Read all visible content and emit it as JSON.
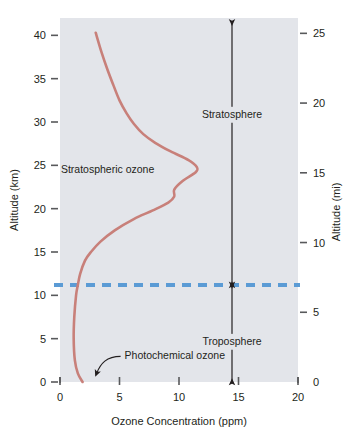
{
  "chart_data": {
    "type": "line",
    "title": "",
    "xlabel": "Ozone Concentration (ppm)",
    "ylabel": "Altitude (km)",
    "y2label": "Altitude (mi)",
    "xlim": [
      0,
      20
    ],
    "ylim": [
      0,
      42
    ],
    "y2lim": [
      0,
      26.1
    ],
    "grid": false,
    "legend": "none",
    "xticks": [
      0,
      5,
      10,
      15,
      20
    ],
    "xticklabels": [
      "0",
      "5",
      "10",
      "15",
      "20"
    ],
    "yticks": [
      0,
      5,
      10,
      15,
      20,
      25,
      30,
      35,
      40
    ],
    "yticklabels": [
      "0",
      "5",
      "10",
      "15",
      "20",
      "25",
      "30",
      "35",
      "40"
    ],
    "y2ticks": [
      0,
      5,
      10,
      15,
      20,
      25
    ],
    "y2ticklabels": [
      "0",
      "5",
      "10",
      "15",
      "20",
      "25"
    ],
    "series": [
      {
        "name": "Ozone concentration profile",
        "color": "#c8807a",
        "x_is_concentration": true,
        "points": [
          {
            "ozone_ppm": 1.9,
            "altitude_km": 0.0
          },
          {
            "ozone_ppm": 1.5,
            "altitude_km": 1.0
          },
          {
            "ozone_ppm": 1.25,
            "altitude_km": 2.5
          },
          {
            "ozone_ppm": 1.15,
            "altitude_km": 5.0
          },
          {
            "ozone_ppm": 1.2,
            "altitude_km": 7.5
          },
          {
            "ozone_ppm": 1.35,
            "altitude_km": 10.0
          },
          {
            "ozone_ppm": 1.5,
            "altitude_km": 11.2
          },
          {
            "ozone_ppm": 1.7,
            "altitude_km": 12.5
          },
          {
            "ozone_ppm": 2.1,
            "altitude_km": 14.0
          },
          {
            "ozone_ppm": 2.6,
            "altitude_km": 15.0
          },
          {
            "ozone_ppm": 3.4,
            "altitude_km": 16.2
          },
          {
            "ozone_ppm": 4.6,
            "altitude_km": 17.5
          },
          {
            "ozone_ppm": 6.2,
            "altitude_km": 18.8
          },
          {
            "ozone_ppm": 7.8,
            "altitude_km": 19.8
          },
          {
            "ozone_ppm": 9.1,
            "altitude_km": 20.7
          },
          {
            "ozone_ppm": 9.6,
            "altitude_km": 21.4
          },
          {
            "ozone_ppm": 9.6,
            "altitude_km": 22.2
          },
          {
            "ozone_ppm": 10.3,
            "altitude_km": 23.2
          },
          {
            "ozone_ppm": 11.4,
            "altitude_km": 24.2
          },
          {
            "ozone_ppm": 11.5,
            "altitude_km": 24.8
          },
          {
            "ozone_ppm": 10.8,
            "altitude_km": 25.6
          },
          {
            "ozone_ppm": 9.3,
            "altitude_km": 26.6
          },
          {
            "ozone_ppm": 8.0,
            "altitude_km": 27.6
          },
          {
            "ozone_ppm": 7.0,
            "altitude_km": 28.6
          },
          {
            "ozone_ppm": 6.2,
            "altitude_km": 29.8
          },
          {
            "ozone_ppm": 5.6,
            "altitude_km": 31.0
          },
          {
            "ozone_ppm": 5.0,
            "altitude_km": 32.5
          },
          {
            "ozone_ppm": 4.5,
            "altitude_km": 34.2
          },
          {
            "ozone_ppm": 4.0,
            "altitude_km": 36.0
          },
          {
            "ozone_ppm": 3.5,
            "altitude_km": 38.0
          },
          {
            "ozone_ppm": 3.0,
            "altitude_km": 40.3
          }
        ]
      }
    ],
    "reference_lines": [
      {
        "name": "tropopause",
        "orientation": "horizontal",
        "altitude_km": 11.2,
        "style": "dashed",
        "color": "#5b9bd5"
      }
    ],
    "annotations": [
      {
        "name": "stratospheric-ozone",
        "text": "Stratospheric ozone",
        "ozone_ppm": 4.0,
        "altitude_km": 24.6
      },
      {
        "name": "photochemical-ozone",
        "text": "Photochemical ozone",
        "ozone_ppm": 6.1,
        "altitude_km": 3.3
      }
    ],
    "zones": [
      {
        "name": "stratosphere",
        "label": "Stratosphere",
        "from_km": 11.2,
        "to_km": 41.5,
        "label_altitude_km": 30.6
      },
      {
        "name": "troposphere",
        "label": "Troposphere",
        "from_km": 0.0,
        "to_km": 11.2,
        "label_altitude_km": 4.4
      }
    ]
  },
  "colors": {
    "plot_background": "#e3e5ea",
    "curve": "#c8807a",
    "tropopause": "#5b9bd5",
    "axis": "#58595b",
    "text": "#231f20",
    "page_background": "#ffffff"
  }
}
